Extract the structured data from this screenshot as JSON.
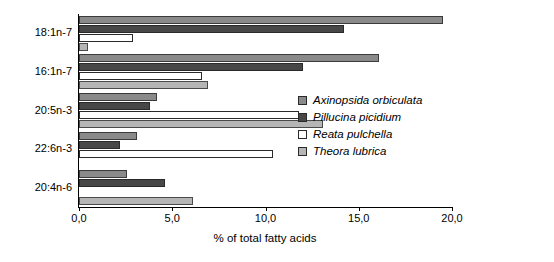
{
  "chart_data": {
    "type": "bar",
    "orientation": "horizontal",
    "title": "",
    "xlabel": "% of total fatty acids",
    "ylabel": "",
    "xlim": [
      0.0,
      20.0
    ],
    "xticks": [
      "0,0",
      "5,0",
      "10,0",
      "15,0",
      "20,0"
    ],
    "xtick_values": [
      0,
      5,
      10,
      15,
      20
    ],
    "grid": false,
    "legend_position": "inside-right",
    "categories": [
      "18:1n-7",
      "16:1n-7",
      "20:5n-3",
      "22:6n-3",
      "20:4n-6"
    ],
    "series": [
      {
        "name": "Axinopsida orbiculata",
        "color": "#8a8a8a",
        "values": [
          19.5,
          16.1,
          4.2,
          3.1,
          2.6
        ]
      },
      {
        "name": "Pillucina picidium",
        "color": "#474747",
        "values": [
          14.2,
          12.0,
          3.8,
          2.2,
          4.6
        ]
      },
      {
        "name": "Reata pulchella",
        "color": "#ffffff",
        "values": [
          2.9,
          6.6,
          11.8,
          10.4,
          0.0
        ]
      },
      {
        "name": "Theora lubrica",
        "color": "#b5b5b5",
        "values": [
          0.5,
          6.9,
          13.1,
          0.0,
          6.1
        ]
      }
    ]
  },
  "legend": {
    "items": [
      {
        "label": "Axinopsida orbiculata"
      },
      {
        "label": "Pillucina picidium"
      },
      {
        "label": "Reata pulchella"
      },
      {
        "label": "Theora lubrica"
      }
    ]
  }
}
